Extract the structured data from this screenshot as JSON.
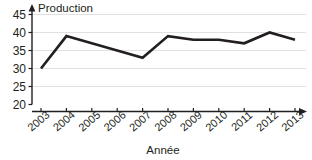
{
  "chart_data": {
    "type": "line",
    "title": "",
    "xlabel": "Année",
    "ylabel": "Production",
    "categories": [
      "2003",
      "2004",
      "2005",
      "2006",
      "2007",
      "2008",
      "2009",
      "2010",
      "2011",
      "2012",
      "2013"
    ],
    "values": [
      30,
      39,
      37,
      35,
      33,
      39,
      38,
      38,
      37,
      40,
      38
    ],
    "series": [
      {
        "name": "Production",
        "values": [
          30,
          39,
          37,
          35,
          33,
          39,
          38,
          38,
          37,
          40,
          38
        ]
      }
    ],
    "ylim": [
      20,
      45
    ],
    "yticks": [
      20,
      25,
      30,
      35,
      40,
      45
    ],
    "ytick_labels": [
      "20",
      "25",
      "30",
      "35",
      "40",
      "45"
    ],
    "xlim": [
      "2003",
      "2013"
    ],
    "grid": true,
    "grid_axis": "y",
    "legend": false,
    "legend_position": "none",
    "line_color": "#231f20",
    "grid_color": "#d9d9d9",
    "axis_color": "#231f20",
    "x_axis_arrow": true,
    "y_axis_arrow": true,
    "xtick_label_rotation": -40
  },
  "axes": {
    "y_title": "Production",
    "x_title": "Année"
  }
}
